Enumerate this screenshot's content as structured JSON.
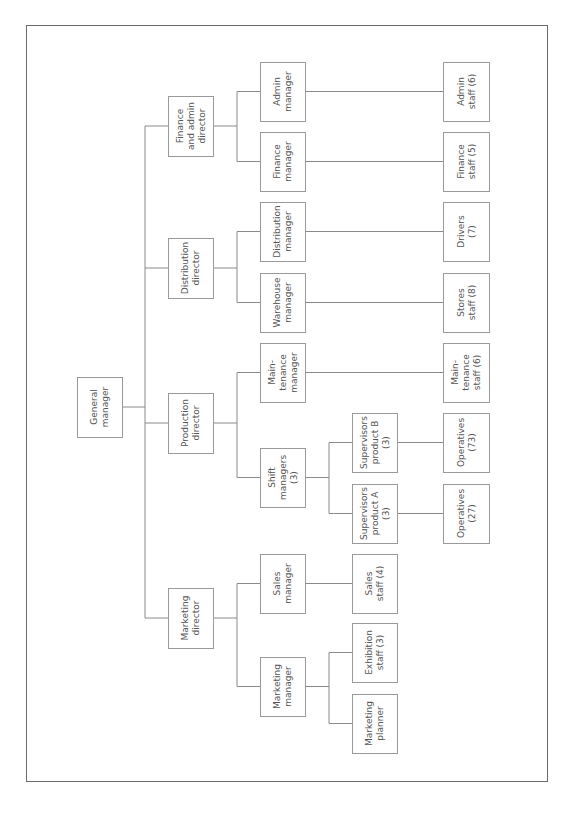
{
  "diagram": {
    "type": "org-chart",
    "orientation": "rotated-90-ccw",
    "nodes": [
      {
        "id": "gm",
        "lines": [
          "General",
          "manager"
        ],
        "x": 77,
        "y": 377,
        "w": 45,
        "h": 60
      },
      {
        "id": "fad",
        "lines": [
          "Finance",
          "and admin",
          "director"
        ],
        "x": 168,
        "y": 96,
        "w": 45,
        "h": 60
      },
      {
        "id": "dd",
        "lines": [
          "Distribution",
          "director"
        ],
        "x": 168,
        "y": 238,
        "w": 45,
        "h": 60
      },
      {
        "id": "pd",
        "lines": [
          "Production",
          "director"
        ],
        "x": 168,
        "y": 393,
        "w": 45,
        "h": 60
      },
      {
        "id": "md",
        "lines": [
          "Marketing",
          "director"
        ],
        "x": 168,
        "y": 588,
        "w": 45,
        "h": 60
      },
      {
        "id": "am",
        "lines": [
          "Admin",
          "manager"
        ],
        "x": 260,
        "y": 62,
        "w": 45,
        "h": 59
      },
      {
        "id": "fm",
        "lines": [
          "Finance",
          "manager"
        ],
        "x": 260,
        "y": 132,
        "w": 45,
        "h": 59
      },
      {
        "id": "dm",
        "lines": [
          "Distribution",
          "manager"
        ],
        "x": 260,
        "y": 202,
        "w": 45,
        "h": 59
      },
      {
        "id": "wm",
        "lines": [
          "Warehouse",
          "manager"
        ],
        "x": 260,
        "y": 273,
        "w": 45,
        "h": 59
      },
      {
        "id": "mtm",
        "lines": [
          "Main-",
          "tenance",
          "manager"
        ],
        "x": 260,
        "y": 343,
        "w": 45,
        "h": 59
      },
      {
        "id": "sm",
        "lines": [
          "Shift",
          "managers",
          "(3)"
        ],
        "x": 260,
        "y": 448,
        "w": 45,
        "h": 59
      },
      {
        "id": "slm",
        "lines": [
          "Sales",
          "manager"
        ],
        "x": 260,
        "y": 554,
        "w": 45,
        "h": 59
      },
      {
        "id": "mm",
        "lines": [
          "Marketing",
          "manager"
        ],
        "x": 260,
        "y": 657,
        "w": 45,
        "h": 59
      },
      {
        "id": "spb",
        "lines": [
          "Supervisors",
          "product B",
          "(3)"
        ],
        "x": 352,
        "y": 413,
        "w": 45,
        "h": 59
      },
      {
        "id": "spa",
        "lines": [
          "Supervisors",
          "product A",
          "(3)"
        ],
        "x": 352,
        "y": 484,
        "w": 45,
        "h": 59
      },
      {
        "id": "ss",
        "lines": [
          "Sales",
          "staff (4)"
        ],
        "x": 352,
        "y": 554,
        "w": 45,
        "h": 59
      },
      {
        "id": "es",
        "lines": [
          "Exhibition",
          "staff (3)"
        ],
        "x": 352,
        "y": 623,
        "w": 45,
        "h": 59
      },
      {
        "id": "mp",
        "lines": [
          "Marketing",
          "planner"
        ],
        "x": 352,
        "y": 694,
        "w": 45,
        "h": 59
      },
      {
        "id": "ast",
        "lines": [
          "Admin",
          "staff (6)"
        ],
        "x": 443,
        "y": 62,
        "w": 46,
        "h": 59
      },
      {
        "id": "fst",
        "lines": [
          "Finance",
          "staff (5)"
        ],
        "x": 443,
        "y": 132,
        "w": 46,
        "h": 59
      },
      {
        "id": "drv",
        "lines": [
          "Drivers",
          "(7)"
        ],
        "x": 443,
        "y": 202,
        "w": 46,
        "h": 59
      },
      {
        "id": "sts",
        "lines": [
          "Stores",
          "staff (8)"
        ],
        "x": 443,
        "y": 273,
        "w": 46,
        "h": 59
      },
      {
        "id": "mts",
        "lines": [
          "Main-",
          "tenance",
          "staff (6)"
        ],
        "x": 443,
        "y": 343,
        "w": 46,
        "h": 59
      },
      {
        "id": "opb",
        "lines": [
          "Operatives",
          "(73)"
        ],
        "x": 443,
        "y": 413,
        "w": 46,
        "h": 59
      },
      {
        "id": "opa",
        "lines": [
          "Operatives",
          "(27)"
        ],
        "x": 443,
        "y": 484,
        "w": 46,
        "h": 59
      }
    ],
    "edges": [
      [
        "gm",
        "fad"
      ],
      [
        "gm",
        "dd"
      ],
      [
        "gm",
        "pd"
      ],
      [
        "gm",
        "md"
      ],
      [
        "fad",
        "am"
      ],
      [
        "fad",
        "fm"
      ],
      [
        "dd",
        "dm"
      ],
      [
        "dd",
        "wm"
      ],
      [
        "pd",
        "mtm"
      ],
      [
        "pd",
        "sm"
      ],
      [
        "md",
        "slm"
      ],
      [
        "md",
        "mm"
      ],
      [
        "sm",
        "spb"
      ],
      [
        "sm",
        "spa"
      ],
      [
        "mm",
        "es"
      ],
      [
        "mm",
        "mp"
      ],
      [
        "slm",
        "ss"
      ],
      [
        "am",
        "ast"
      ],
      [
        "fm",
        "fst"
      ],
      [
        "dm",
        "drv"
      ],
      [
        "wm",
        "sts"
      ],
      [
        "mtm",
        "mts"
      ],
      [
        "spb",
        "opb"
      ],
      [
        "spa",
        "opa"
      ]
    ],
    "colors": {
      "line": "#8a8a8a",
      "box_border": "#9a9a9a",
      "text": "#555555",
      "frame": "#6b6b6b"
    }
  }
}
